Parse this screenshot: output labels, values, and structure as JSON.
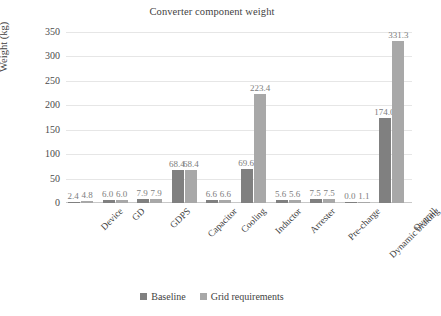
{
  "chart_data": {
    "type": "bar",
    "title": "Converter component weight",
    "xlabel": "",
    "ylabel": "Weight (kg)",
    "ylim": [
      0,
      350
    ],
    "ytick_step": 50,
    "yticks": [
      "0",
      "50",
      "100",
      "150",
      "200",
      "250",
      "300",
      "350"
    ],
    "grid": true,
    "legend_position": "bottom",
    "categories": [
      "Device",
      "GD",
      "GDPS",
      "Capacitor",
      "Cooling",
      "Inductor",
      "Arrester",
      "Pre-charge",
      "Dynamic braking",
      "Overall"
    ],
    "series": [
      {
        "name": "Baseline",
        "color": "#808080",
        "values": [
          2.4,
          6.0,
          7.9,
          68.4,
          6.6,
          69.6,
          5.6,
          7.5,
          0.0,
          174.0
        ],
        "labels": [
          "2.4",
          "6.0",
          "7.9",
          "68.4",
          "6.6",
          "69.6",
          "5.6",
          "7.5",
          "0.0",
          "174.0"
        ]
      },
      {
        "name": "Grid requirements",
        "color": "#a8a8a8",
        "values": [
          4.8,
          6.0,
          7.9,
          68.4,
          6.6,
          223.4,
          5.6,
          7.5,
          1.1,
          331.3
        ],
        "labels": [
          "4.8",
          "6.0",
          "7.9",
          "68.4",
          "6.6",
          "223.4",
          "5.6",
          "7.5",
          "1.1",
          "331.3"
        ]
      }
    ]
  },
  "legend": {
    "items": [
      {
        "label": "Baseline",
        "color": "#808080"
      },
      {
        "label": "Grid requirements",
        "color": "#a8a8a8"
      }
    ]
  },
  "colors": {
    "baseline": "#808080",
    "grid_requirements": "#a8a8a8",
    "gridline": "#e6e6e6",
    "text": "#3f3f3f",
    "data_label": "#7d7d7d",
    "background": "#ffffff"
  }
}
